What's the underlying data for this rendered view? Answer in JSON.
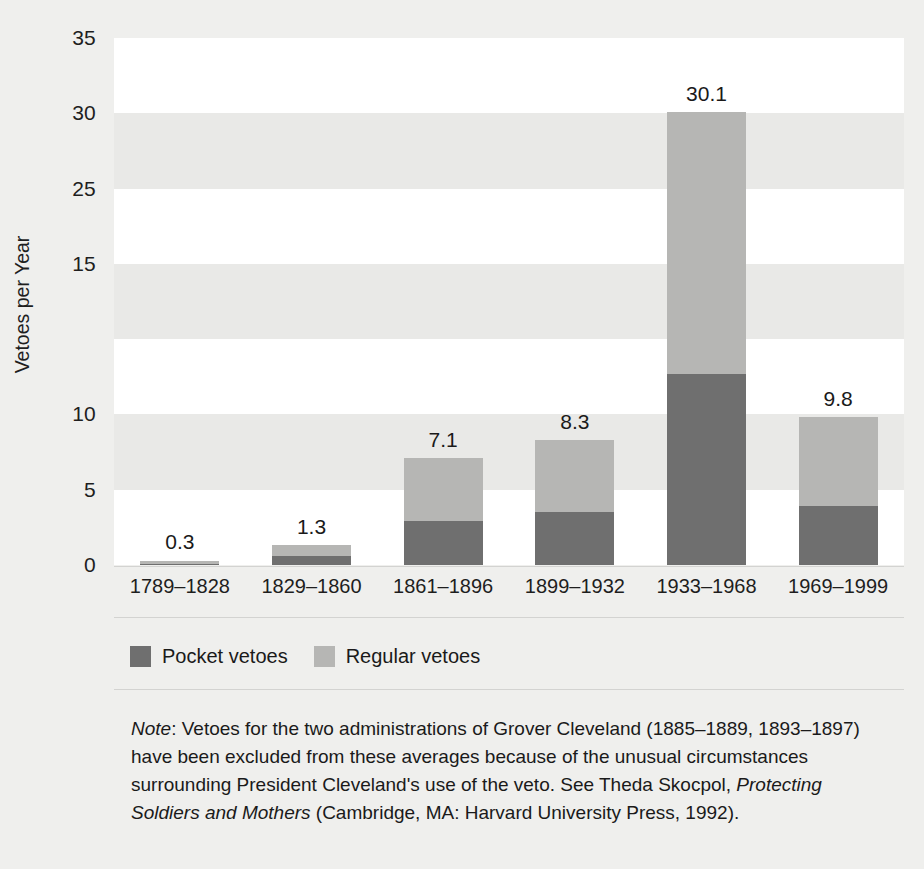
{
  "chart_data": {
    "type": "bar",
    "subtype": "stacked-bar",
    "title": "",
    "xlabel": "",
    "ylabel": "Vetoes per Year",
    "ylim": [
      0,
      35
    ],
    "ytick_labels": [
      "35",
      "30",
      "25",
      "15",
      "10",
      "5",
      "0"
    ],
    "ytick_positions": [
      35,
      30,
      25,
      20,
      10,
      5,
      0
    ],
    "grid": false,
    "banding": "alternating horizontal bands every 5 units",
    "legend_position": "below-axis-left",
    "categories": [
      "1789–1828",
      "1829–1860",
      "1861–1896",
      "1899–1932",
      "1933–1968",
      "1969–1999"
    ],
    "series": [
      {
        "name": "Pocket vetoes",
        "color": "#6f6f6f",
        "values": [
          0.1,
          0.6,
          2.9,
          3.5,
          12.7,
          3.9
        ]
      },
      {
        "name": "Regular vetoes",
        "color": "#b6b6b4",
        "values": [
          0.2,
          0.7,
          4.2,
          4.8,
          17.4,
          5.9
        ]
      }
    ],
    "totals": [
      0.3,
      1.3,
      7.1,
      8.3,
      30.1,
      9.8
    ],
    "total_labels": [
      "0.3",
      "1.3",
      "7.1",
      "8.3",
      "30.1",
      "9.8"
    ]
  },
  "legend": {
    "items": [
      {
        "label": "Pocket vetoes",
        "color": "#6f6f6f"
      },
      {
        "label": "Regular vetoes",
        "color": "#b6b6b4"
      }
    ]
  },
  "note": {
    "prefix": "Note",
    "body_1": ": Vetoes for the two administrations of Grover Cleveland (1885–1889, 1893–1897) have been excluded from these averages because of the unusual circumstances surrounding President Cleveland's use of the veto. See Theda Skocpol, ",
    "italic_title": "Protecting Soldiers and Mothers",
    "body_2": " (Cambridge, MA: Harvard University Press, 1992)."
  },
  "colors": {
    "pocket": "#6f6f6f",
    "regular": "#b6b6b4",
    "band_white": "#ffffff",
    "band_gray": "#e9e9e7",
    "page_background": "#efefed",
    "text": "#1a1a1a"
  }
}
